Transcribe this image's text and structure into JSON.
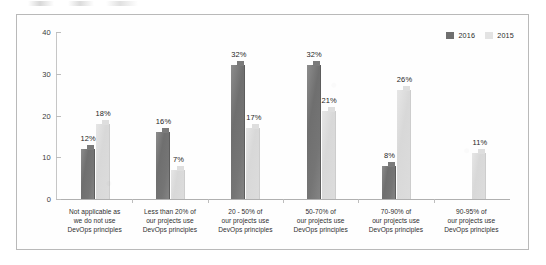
{
  "chart_data": {
    "type": "bar",
    "title": "",
    "subtitle": "",
    "xlabel": "",
    "ylabel": "",
    "ylim": [
      0,
      40
    ],
    "yticks": [
      0,
      10,
      20,
      30,
      40
    ],
    "grid": false,
    "legend_position": "top-right",
    "categories": [
      "Not applicable as we do not use DevOps principles",
      "Less than 20% of our projects use DevOps principles",
      "20 - 50% of our projects use DevOps principles",
      "50-70% of our projects use DevOps principles",
      "70-90% of our projects use DevOps principles",
      "90-95% of our projects use DevOps principles"
    ],
    "category_lines": [
      [
        "Not applicable as",
        "we do not use",
        "DevOps principles"
      ],
      [
        "Less than 20% of",
        "our projects use",
        "DevOps principles"
      ],
      [
        "20 - 50% of",
        "our projects use",
        "DevOps principles"
      ],
      [
        "50-70% of",
        "our projects use",
        "DevOps principles"
      ],
      [
        "70-90% of",
        "our projects use",
        "DevOps principles"
      ],
      [
        "90-95% of",
        "our projects use",
        "DevOps principles"
      ]
    ],
    "series": [
      {
        "name": "2016",
        "color": "#6f6f6f",
        "values": [
          12,
          16,
          32,
          32,
          8,
          null
        ],
        "labels": [
          "12%",
          "16%",
          "32%",
          "32%",
          "8%",
          ""
        ]
      },
      {
        "name": "2015",
        "color": "#dcdcdc",
        "values": [
          18,
          7,
          17,
          21,
          26,
          11
        ],
        "labels": [
          "18%",
          "7%",
          "17%",
          "21%",
          "26%",
          "11%"
        ]
      }
    ]
  },
  "legend": {
    "items": [
      {
        "label": "2016",
        "swatch": "#6f6f6f"
      },
      {
        "label": "2015",
        "swatch": "#e3e3e3"
      }
    ]
  },
  "axis": {
    "y_tick_labels": [
      "40",
      "30",
      "20",
      "10",
      "0"
    ]
  }
}
